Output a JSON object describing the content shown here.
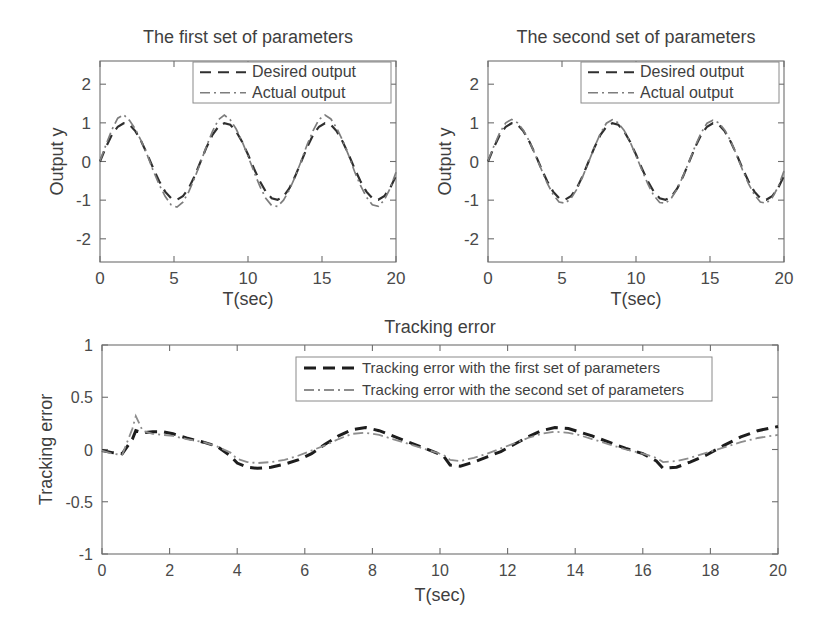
{
  "figure": {
    "background": "#ffffff",
    "width": 824,
    "height": 636
  },
  "colors": {
    "axis": "#6e6e6e",
    "text": "#3f3f3f",
    "desired": "#2f2f2f",
    "actual": "#7d7d7d",
    "error_first": "#1d1d1d",
    "error_second": "#8d8d8d"
  },
  "chart_data": [
    {
      "id": "first-set",
      "type": "line",
      "title": "The first set of parameters",
      "xlabel": "T(sec)",
      "ylabel": "Output y",
      "xlim": [
        0,
        20
      ],
      "ylim": [
        -2.6,
        2.6
      ],
      "xticks": [
        0,
        5,
        10,
        15,
        20
      ],
      "xticklabels": [
        "0",
        "5",
        "10",
        "15",
        "20"
      ],
      "yticks": [
        -2,
        -1,
        0,
        1,
        2
      ],
      "yticklabels": [
        "-2",
        "-1",
        "0",
        "1",
        "2"
      ],
      "grid": false,
      "legend_position": "top-right",
      "series": [
        {
          "name": "Desired output",
          "linestyle": "dashed",
          "color": "#2f2f2f",
          "x": [
            0,
            0.4,
            0.8,
            1.2,
            1.6,
            2.0,
            2.4,
            2.8,
            3.2,
            3.6,
            4.0,
            4.4,
            4.8,
            5.2,
            5.6,
            6.0,
            6.4,
            6.8,
            7.2,
            7.6,
            8.0,
            8.4,
            8.8,
            9.2,
            9.6,
            10.0,
            10.4,
            10.8,
            11.2,
            11.6,
            12.0,
            12.4,
            12.8,
            13.2,
            13.6,
            14.0,
            14.4,
            14.8,
            15.2,
            15.6,
            16.0,
            16.4,
            16.8,
            17.2,
            17.6,
            18.0,
            18.4,
            18.8,
            19.2,
            19.6,
            20.0
          ],
          "y": [
            0.0,
            0.37,
            0.69,
            0.9,
            0.99,
            0.95,
            0.78,
            0.51,
            0.18,
            -0.18,
            -0.51,
            -0.78,
            -0.95,
            -0.99,
            -0.9,
            -0.69,
            -0.37,
            0.0,
            0.37,
            0.69,
            0.9,
            0.99,
            0.95,
            0.78,
            0.51,
            0.18,
            -0.18,
            -0.51,
            -0.78,
            -0.95,
            -0.99,
            -0.9,
            -0.69,
            -0.37,
            0.0,
            0.37,
            0.69,
            0.9,
            0.99,
            0.95,
            0.78,
            0.51,
            0.18,
            -0.18,
            -0.51,
            -0.78,
            -0.95,
            -0.99,
            -0.9,
            -0.69,
            -0.37
          ]
        },
        {
          "name": "Actual output",
          "linestyle": "dashdot",
          "color": "#7d7d7d",
          "x": [
            0,
            0.4,
            0.8,
            1.2,
            1.6,
            2.0,
            2.4,
            2.8,
            3.2,
            3.6,
            4.0,
            4.4,
            4.8,
            5.2,
            5.6,
            6.0,
            6.4,
            6.8,
            7.2,
            7.6,
            8.0,
            8.4,
            8.8,
            9.2,
            9.6,
            10.0,
            10.4,
            10.8,
            11.2,
            11.6,
            12.0,
            12.4,
            12.8,
            13.2,
            13.6,
            14.0,
            14.4,
            14.8,
            15.2,
            15.6,
            16.0,
            16.4,
            16.8,
            17.2,
            17.6,
            18.0,
            18.4,
            18.8,
            19.2,
            19.6,
            20.0
          ],
          "y": [
            0.02,
            0.43,
            0.82,
            1.12,
            1.21,
            1.06,
            0.83,
            0.52,
            0.16,
            -0.24,
            -0.6,
            -0.9,
            -1.12,
            -1.18,
            -1.05,
            -0.78,
            -0.42,
            -0.02,
            0.4,
            0.78,
            1.08,
            1.2,
            1.08,
            0.84,
            0.52,
            0.14,
            -0.26,
            -0.64,
            -0.95,
            -1.14,
            -1.16,
            -1.0,
            -0.73,
            -0.38,
            0.02,
            0.44,
            0.8,
            1.09,
            1.2,
            1.1,
            0.86,
            0.54,
            0.16,
            -0.26,
            -0.62,
            -0.92,
            -1.12,
            -1.16,
            -1.0,
            -0.7,
            -0.28
          ]
        }
      ]
    },
    {
      "id": "second-set",
      "type": "line",
      "title": "The second set of parameters",
      "xlabel": "T(sec)",
      "ylabel": "Output y",
      "xlim": [
        0,
        20
      ],
      "ylim": [
        -2.6,
        2.6
      ],
      "xticks": [
        0,
        5,
        10,
        15,
        20
      ],
      "xticklabels": [
        "0",
        "5",
        "10",
        "15",
        "20"
      ],
      "yticks": [
        -2,
        -1,
        0,
        1,
        2
      ],
      "yticklabels": [
        "-2",
        "-1",
        "0",
        "1",
        "2"
      ],
      "grid": false,
      "legend_position": "top-right",
      "series": [
        {
          "name": "Desired output",
          "linestyle": "dashed",
          "color": "#2f2f2f",
          "x": [
            0,
            0.4,
            0.8,
            1.2,
            1.6,
            2.0,
            2.4,
            2.8,
            3.2,
            3.6,
            4.0,
            4.4,
            4.8,
            5.2,
            5.6,
            6.0,
            6.4,
            6.8,
            7.2,
            7.6,
            8.0,
            8.4,
            8.8,
            9.2,
            9.6,
            10.0,
            10.4,
            10.8,
            11.2,
            11.6,
            12.0,
            12.4,
            12.8,
            13.2,
            13.6,
            14.0,
            14.4,
            14.8,
            15.2,
            15.6,
            16.0,
            16.4,
            16.8,
            17.2,
            17.6,
            18.0,
            18.4,
            18.8,
            19.2,
            19.6,
            20.0
          ],
          "y": [
            0.0,
            0.37,
            0.69,
            0.9,
            0.99,
            0.95,
            0.78,
            0.51,
            0.18,
            -0.18,
            -0.51,
            -0.78,
            -0.95,
            -0.99,
            -0.9,
            -0.69,
            -0.37,
            0.0,
            0.37,
            0.69,
            0.9,
            0.99,
            0.95,
            0.78,
            0.51,
            0.18,
            -0.18,
            -0.51,
            -0.78,
            -0.95,
            -0.99,
            -0.9,
            -0.69,
            -0.37,
            0.0,
            0.37,
            0.69,
            0.9,
            0.99,
            0.95,
            0.78,
            0.51,
            0.18,
            -0.18,
            -0.51,
            -0.78,
            -0.95,
            -0.99,
            -0.9,
            -0.69,
            -0.37
          ]
        },
        {
          "name": "Actual output",
          "linestyle": "dashdot",
          "color": "#7d7d7d",
          "x": [
            0,
            0.4,
            0.8,
            1.2,
            1.6,
            2.0,
            2.4,
            2.8,
            3.2,
            3.6,
            4.0,
            4.4,
            4.8,
            5.2,
            5.6,
            6.0,
            6.4,
            6.8,
            7.2,
            7.6,
            8.0,
            8.4,
            8.8,
            9.2,
            9.6,
            10.0,
            10.4,
            10.8,
            11.2,
            11.6,
            12.0,
            12.4,
            12.8,
            13.2,
            13.6,
            14.0,
            14.4,
            14.8,
            15.2,
            15.6,
            16.0,
            16.4,
            16.8,
            17.2,
            17.6,
            18.0,
            18.4,
            18.8,
            19.2,
            19.6,
            20.0
          ],
          "y": [
            0.02,
            0.4,
            0.75,
            1.0,
            1.09,
            1.0,
            0.8,
            0.52,
            0.17,
            -0.2,
            -0.56,
            -0.85,
            -1.05,
            -1.08,
            -0.96,
            -0.72,
            -0.39,
            -0.01,
            0.38,
            0.73,
            0.99,
            1.08,
            1.0,
            0.8,
            0.51,
            0.15,
            -0.22,
            -0.58,
            -0.88,
            -1.06,
            -1.08,
            -0.94,
            -0.7,
            -0.36,
            0.01,
            0.4,
            0.74,
            0.99,
            1.07,
            1.0,
            0.81,
            0.53,
            0.17,
            -0.22,
            -0.57,
            -0.86,
            -1.05,
            -1.08,
            -0.94,
            -0.66,
            -0.25
          ]
        }
      ]
    },
    {
      "id": "tracking-error",
      "type": "line",
      "title": "Tracking error",
      "xlabel": "T(sec)",
      "ylabel": "Tracking error",
      "xlim": [
        0,
        20
      ],
      "ylim": [
        -1,
        1
      ],
      "xticks": [
        0,
        2,
        4,
        6,
        8,
        10,
        12,
        14,
        16,
        18,
        20
      ],
      "xticklabels": [
        "0",
        "2",
        "4",
        "6",
        "8",
        "10",
        "12",
        "14",
        "16",
        "18",
        "20"
      ],
      "yticks": [
        -1,
        -0.5,
        0,
        0.5,
        1
      ],
      "yticklabels": [
        "-1",
        "-0.5",
        "0",
        "0.5",
        "1"
      ],
      "grid": false,
      "legend_position": "top-right",
      "series": [
        {
          "name": "Tracking error with  the first set of parameters",
          "linestyle": "dashed",
          "color": "#1d1d1d",
          "x": [
            0,
            0.3,
            0.6,
            0.9,
            1.0,
            1.2,
            1.5,
            1.8,
            2.1,
            2.5,
            3.0,
            3.4,
            3.8,
            4.0,
            4.3,
            4.6,
            5.0,
            5.4,
            5.8,
            6.2,
            6.6,
            7.0,
            7.4,
            7.8,
            8.2,
            8.6,
            9.0,
            9.4,
            9.8,
            10.1,
            10.3,
            10.6,
            11.0,
            11.4,
            11.8,
            12.2,
            12.6,
            13.0,
            13.4,
            13.8,
            14.1,
            14.5,
            15.0,
            15.5,
            16.0,
            16.4,
            16.6,
            17.0,
            17.4,
            17.9,
            18.4,
            18.9,
            19.4,
            20.0
          ],
          "y": [
            -0.01,
            -0.03,
            -0.04,
            0.1,
            0.18,
            0.16,
            0.17,
            0.17,
            0.15,
            0.11,
            0.07,
            0.03,
            -0.06,
            -0.13,
            -0.17,
            -0.18,
            -0.17,
            -0.14,
            -0.1,
            -0.04,
            0.05,
            0.13,
            0.19,
            0.21,
            0.18,
            0.13,
            0.08,
            0.03,
            -0.02,
            -0.06,
            -0.15,
            -0.16,
            -0.12,
            -0.07,
            -0.02,
            0.05,
            0.12,
            0.18,
            0.21,
            0.2,
            0.17,
            0.13,
            0.07,
            0.01,
            -0.04,
            -0.11,
            -0.18,
            -0.17,
            -0.12,
            -0.05,
            0.04,
            0.12,
            0.18,
            0.22
          ]
        },
        {
          "name": "Tracking error with  the second set of parameters",
          "linestyle": "dashdot",
          "color": "#8d8d8d",
          "x": [
            0,
            0.3,
            0.6,
            0.9,
            1.0,
            1.2,
            1.5,
            1.8,
            2.1,
            2.5,
            3.0,
            3.4,
            3.8,
            4.0,
            4.3,
            4.6,
            5.0,
            5.4,
            5.8,
            6.2,
            6.6,
            7.0,
            7.4,
            7.8,
            8.2,
            8.6,
            9.0,
            9.4,
            9.8,
            10.1,
            10.3,
            10.6,
            11.0,
            11.4,
            11.8,
            12.2,
            12.6,
            13.0,
            13.4,
            13.8,
            14.1,
            14.5,
            15.0,
            15.5,
            16.0,
            16.4,
            16.6,
            17.0,
            17.4,
            17.9,
            18.4,
            18.9,
            19.4,
            20.0
          ],
          "y": [
            -0.01,
            -0.04,
            -0.05,
            0.2,
            0.32,
            0.18,
            0.15,
            0.14,
            0.13,
            0.1,
            0.07,
            0.03,
            -0.03,
            -0.09,
            -0.12,
            -0.13,
            -0.12,
            -0.1,
            -0.06,
            -0.01,
            0.04,
            0.1,
            0.15,
            0.16,
            0.14,
            0.1,
            0.06,
            0.02,
            -0.02,
            -0.05,
            -0.1,
            -0.11,
            -0.08,
            -0.04,
            0.01,
            0.06,
            0.11,
            0.15,
            0.17,
            0.16,
            0.14,
            0.1,
            0.05,
            0.0,
            -0.04,
            -0.08,
            -0.12,
            -0.11,
            -0.08,
            -0.03,
            0.02,
            0.07,
            0.11,
            0.14
          ]
        }
      ]
    }
  ]
}
